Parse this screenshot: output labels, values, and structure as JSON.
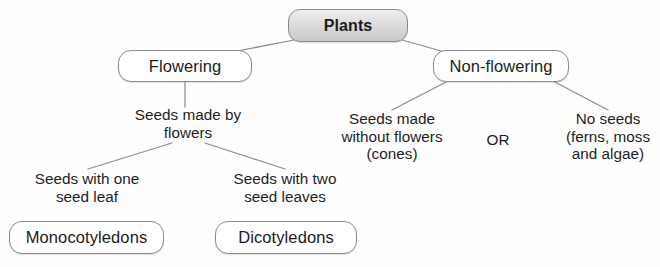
{
  "diagram": {
    "background_color": "#ffffff",
    "line_color": "#8d8d8d",
    "text_color": "#1e1e1e",
    "root_fill": "#dcdcdc",
    "box_border_color": "#8b8b8b"
  },
  "nodes": {
    "root": {
      "label": "Plants",
      "x": 288,
      "y": 9,
      "w": 120,
      "h": 33,
      "style": "box-gray"
    },
    "flowering": {
      "label": "Flowering",
      "x": 118,
      "y": 50,
      "w": 134,
      "h": 32,
      "style": "box-white"
    },
    "non_flowering": {
      "label": "Non-flowering",
      "x": 433,
      "y": 50,
      "w": 136,
      "h": 32,
      "style": "box-white"
    },
    "seeds_made_by_flowers": {
      "lines": [
        "Seeds made by",
        "flowers"
      ],
      "x": 118,
      "y": 106,
      "w": 140,
      "h": 40,
      "style": "plain-text"
    },
    "seeds_made_without_flowers": {
      "lines": [
        "Seeds made",
        "without flowers",
        "(cones)"
      ],
      "x": 330,
      "y": 110,
      "w": 124,
      "h": 58,
      "style": "plain-text"
    },
    "or": {
      "label": "OR",
      "x": 478,
      "y": 131,
      "w": 40,
      "h": 20,
      "style": "plain-text"
    },
    "no_seeds": {
      "lines": [
        "No seeds",
        "(ferns, moss",
        "and algae)"
      ],
      "x": 556,
      "y": 110,
      "w": 104,
      "h": 58,
      "style": "plain-text"
    },
    "seeds_with_one_seed_leaf": {
      "lines": [
        "Seeds with one",
        "seed leaf"
      ],
      "x": 16,
      "y": 170,
      "w": 142,
      "h": 40,
      "style": "plain-text"
    },
    "seeds_with_two_seed_leaves": {
      "lines": [
        "Seeds with two",
        "seed leaves"
      ],
      "x": 214,
      "y": 170,
      "w": 142,
      "h": 40,
      "style": "plain-text"
    },
    "monocotyledons": {
      "label": "Monocotyledons",
      "x": 9,
      "y": 221,
      "w": 155,
      "h": 33,
      "style": "box-white"
    },
    "dicotyledons": {
      "label": "Dicotyledons",
      "x": 215,
      "y": 221,
      "w": 142,
      "h": 33,
      "style": "box-white"
    }
  },
  "connectors": [
    {
      "name": "root-to-flowering",
      "x1": 294,
      "y1": 40,
      "x2": 232,
      "y2": 52
    },
    {
      "name": "root-to-flowering-2",
      "x1": 232,
      "y1": 52,
      "x2": 186,
      "y2": 62
    },
    {
      "name": "root-to-nonflowering",
      "x1": 402,
      "y1": 40,
      "x2": 452,
      "y2": 54
    },
    {
      "name": "root-to-nonflowering-2",
      "x1": 452,
      "y1": 54,
      "x2": 476,
      "y2": 62
    },
    {
      "name": "flowering-to-seeds",
      "x1": 185,
      "y1": 82,
      "x2": 185,
      "y2": 107
    },
    {
      "name": "flowers-to-one-leaf",
      "x1": 172,
      "y1": 143,
      "x2": 88,
      "y2": 169
    },
    {
      "name": "flowers-to-two-leaves",
      "x1": 205,
      "y1": 143,
      "x2": 285,
      "y2": 169
    },
    {
      "name": "nonflowering-to-cones",
      "x1": 448,
      "y1": 81,
      "x2": 392,
      "y2": 110
    },
    {
      "name": "nonflowering-to-noseeds",
      "x1": 553,
      "y1": 81,
      "x2": 608,
      "y2": 110
    }
  ]
}
